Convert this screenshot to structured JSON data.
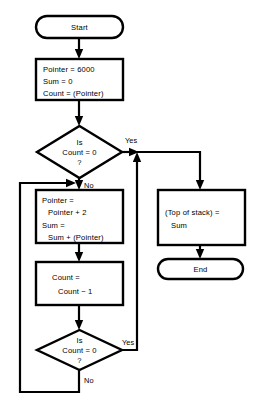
{
  "diagram": {
    "colors": {
      "background": "#ffffff",
      "stroke": "#000000",
      "fill": "#ffffff"
    },
    "nodes": {
      "start": {
        "type": "terminator",
        "label": "Start"
      },
      "init": {
        "type": "process",
        "line1": "Pointer = 6000",
        "line2": "Sum = 0",
        "line3": "Count = (Pointer)"
      },
      "decision_top": {
        "type": "decision",
        "line1": "Is",
        "line2": "Count = 0",
        "line3": "?"
      },
      "accumulate": {
        "type": "process",
        "line1": "Pointer =",
        "line2": "Pointer + 2",
        "line3": "Sum =",
        "line4": "Sum + (Pointer)"
      },
      "decrement": {
        "type": "process",
        "line1": "Count =",
        "line2": "Count − 1"
      },
      "decision_bottom": {
        "type": "decision",
        "line1": "Is",
        "line2": "Count = 0",
        "line3": "?"
      },
      "store": {
        "type": "process",
        "line1": "(Top of stack) =",
        "line2": "Sum"
      },
      "end": {
        "type": "terminator",
        "label": "End"
      }
    },
    "edge_labels": {
      "top_yes": "Yes",
      "top_no": "No",
      "bottom_yes": "Yes",
      "bottom_no": "No"
    }
  }
}
